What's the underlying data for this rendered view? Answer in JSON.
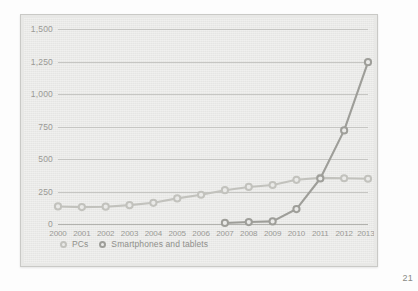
{
  "page": {
    "page_number": "21"
  },
  "colors": {
    "pcs": "#c2c2bd",
    "smartphones": "#9e9e99",
    "grid": "#c6c6c3",
    "axis": "#b2b2ae",
    "plot_background": "#eaeae8",
    "frame_border": "#c9c9c6",
    "text": "#9a9a96"
  },
  "legend": {
    "position": "bottom-left",
    "entries": [
      {
        "label": "PCs",
        "marker": "circle-outline",
        "color": "#c2c2bd"
      },
      {
        "label": "Smartphones and tablets",
        "marker": "circle-outline",
        "color": "#9e9e99"
      }
    ]
  },
  "chart_data": {
    "type": "line",
    "title": "",
    "subtitle": "",
    "xlabel": "",
    "ylabel": "",
    "grid": true,
    "legend_position": "bottom-left",
    "categories": [
      "2000",
      "2001",
      "2002",
      "2003",
      "2004",
      "2005",
      "2006",
      "2007",
      "2008",
      "2009",
      "2010",
      "2011",
      "2012",
      "2013e"
    ],
    "x_tick_labels": [
      "2000",
      "2001",
      "2002",
      "2003",
      "2004",
      "2005",
      "2006",
      "2007",
      "2008",
      "2009",
      "2010",
      "2011",
      "2012",
      "2013e"
    ],
    "y_tick_labels": [
      "0",
      "250",
      "500",
      "750",
      "1,000",
      "1,250",
      "1,500"
    ],
    "y_ticks": [
      0,
      250,
      500,
      750,
      1000,
      1250,
      1500
    ],
    "ylim": [
      0,
      1500
    ],
    "series": [
      {
        "name": "PCs",
        "color": "#c2c2bd",
        "marker": "circle-outline",
        "values": [
          135,
          130,
          133,
          145,
          163,
          197,
          225,
          260,
          285,
          300,
          340,
          355,
          352,
          348
        ]
      },
      {
        "name": "Smartphones and tablets",
        "color": "#9e9e99",
        "marker": "circle-outline",
        "values": [
          null,
          null,
          null,
          null,
          null,
          null,
          null,
          8,
          15,
          20,
          115,
          350,
          720,
          1245
        ]
      }
    ]
  }
}
